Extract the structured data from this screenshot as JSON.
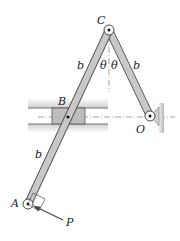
{
  "figure": {
    "labels": {
      "C": "C",
      "B": "B",
      "A": "A",
      "O": "O",
      "P": "P",
      "b_upper_left": "b",
      "b_right": "b",
      "b_lower_left": "b",
      "theta_left": "θ",
      "theta_right": "θ"
    },
    "colors": {
      "link_fill": "#c8c8c8",
      "link_stroke": "#444444",
      "rail_shade": "#d9d9d9",
      "block_fill": "#b9b9b9",
      "wall_fill": "#bdbdbd",
      "line": "#333333"
    }
  }
}
